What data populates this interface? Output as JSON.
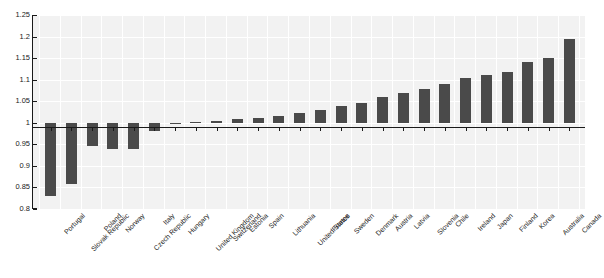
{
  "chart_data": {
    "type": "bar",
    "title": "",
    "subtitle": "",
    "xlabel": "",
    "ylabel": "",
    "ylim": [
      0.8,
      1.25
    ],
    "ytick_values": [
      0.8,
      0.85,
      0.9,
      0.95,
      1.0,
      1.05,
      1.1,
      1.15,
      1.2,
      1.25
    ],
    "ytick_labels": [
      "0.8",
      "0.85",
      "0.9",
      "0.95",
      "1",
      "1.05",
      "1.1",
      "1.15",
      "1.2",
      "1.25"
    ],
    "baseline": 1.0,
    "grid": true,
    "legend": "none",
    "bar_color": "#4a4a4a",
    "plot_background": "#f2f2f2",
    "axis_color": "#1a1a1a",
    "categories": [
      "Portugal",
      "Slovak Republic",
      "Poland",
      "Norway",
      "Czech Republic",
      "Italy",
      "Hungary",
      "United Kingdom",
      "Switzerland",
      "Estonia",
      "Spain",
      "Lithuania",
      "United States",
      "France",
      "Sweden",
      "Denmark",
      "Austria",
      "Latvia",
      "Slovenia",
      "Chile",
      "Ireland",
      "Japan",
      "Finland",
      "Korea",
      "Australia",
      "Canada"
    ],
    "values": [
      0.83,
      0.857,
      0.945,
      0.94,
      0.94,
      0.982,
      0.997,
      1.001,
      1.005,
      1.008,
      1.012,
      1.016,
      1.022,
      1.03,
      1.038,
      1.046,
      1.06,
      1.068,
      1.078,
      1.09,
      1.105,
      1.11,
      1.118,
      1.14,
      1.15,
      1.195
    ]
  }
}
